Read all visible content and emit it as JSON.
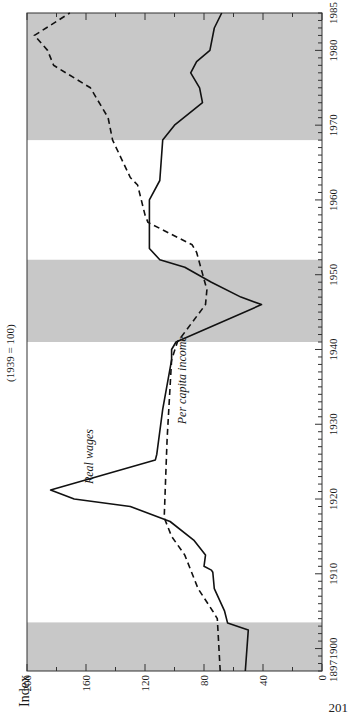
{
  "page_number": "201",
  "chart_data": {
    "type": "line",
    "title": "",
    "subtitle": "(1939 = 100)",
    "ylabel": "Index",
    "xlabel": "",
    "orientation": "rotated 90° counter-clockwise (years run bottom-to-top, index runs right-to-left)",
    "xlim": [
      1897,
      1985
    ],
    "ylim": [
      0,
      200
    ],
    "x_ticks": [
      1897,
      1900,
      1910,
      1920,
      1930,
      1940,
      1950,
      1960,
      1970,
      1980,
      1985
    ],
    "y_ticks": [
      0,
      40,
      80,
      120,
      160,
      200
    ],
    "grid": false,
    "legend": "inline labels",
    "shaded_periods": [
      {
        "start": 1897,
        "end": 1903.5
      },
      {
        "start": 1941,
        "end": 1952
      },
      {
        "start": 1968,
        "end": 1985
      }
    ],
    "shade_color": "#c8c8c8",
    "series": [
      {
        "name": "Real wages",
        "style": "solid",
        "color": "#111111",
        "label_position": {
          "x": 1922,
          "y": 155
        },
        "points": [
          [
            1897,
            52
          ],
          [
            1902.5,
            50
          ],
          [
            1903.4,
            64
          ],
          [
            1905,
            66
          ],
          [
            1908,
            73
          ],
          [
            1910.2,
            74
          ],
          [
            1910.5,
            75
          ],
          [
            1911,
            80
          ],
          [
            1912.5,
            79
          ],
          [
            1914.5,
            87
          ],
          [
            1917,
            103
          ],
          [
            1919,
            130
          ],
          [
            1920,
            168
          ],
          [
            1921.2,
            184
          ],
          [
            1925.2,
            113
          ],
          [
            1926,
            112
          ],
          [
            1932,
            108
          ],
          [
            1938.6,
            102
          ],
          [
            1940,
            102
          ],
          [
            1941,
            99
          ],
          [
            1946,
            41
          ],
          [
            1947,
            55
          ],
          [
            1949,
            75
          ],
          [
            1951,
            93
          ],
          [
            1952,
            110
          ],
          [
            1953.5,
            117
          ],
          [
            1958,
            117
          ],
          [
            1960,
            117
          ],
          [
            1962.6,
            110
          ],
          [
            1968,
            108
          ],
          [
            1970,
            100
          ],
          [
            1973,
            81
          ],
          [
            1975,
            83
          ],
          [
            1977,
            89
          ],
          [
            1978.5,
            85
          ],
          [
            1980,
            76
          ],
          [
            1983,
            73
          ],
          [
            1985,
            68
          ]
        ]
      },
      {
        "name": "Per capita income",
        "style": "dashed",
        "color": "#111111",
        "label_position": {
          "x": 1930,
          "y": 92
        },
        "points": [
          [
            1897,
            69
          ],
          [
            1904,
            71
          ],
          [
            1905,
            74
          ],
          [
            1908,
            84
          ],
          [
            1912.5,
            93
          ],
          [
            1915,
            102
          ],
          [
            1917.5,
            107
          ],
          [
            1923,
            106
          ],
          [
            1928,
            105
          ],
          [
            1938.6,
            102
          ],
          [
            1941,
            98
          ],
          [
            1946,
            79
          ],
          [
            1948,
            78
          ],
          [
            1953,
            85
          ],
          [
            1954,
            88
          ],
          [
            1957,
            118
          ],
          [
            1958,
            120
          ],
          [
            1962,
            125
          ],
          [
            1963,
            130
          ],
          [
            1968,
            142
          ],
          [
            1971,
            145
          ],
          [
            1975,
            157
          ],
          [
            1978,
            182
          ],
          [
            1980,
            186
          ],
          [
            1982,
            195
          ],
          [
            1985,
            171
          ]
        ]
      }
    ]
  }
}
